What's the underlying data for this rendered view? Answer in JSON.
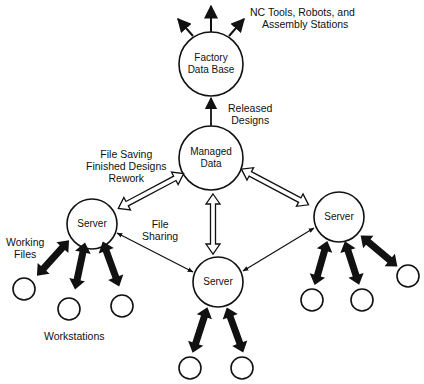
{
  "diagram": {
    "nodes": {
      "factory": {
        "line1": "Factory",
        "line2": "Data Base"
      },
      "managed": {
        "line1": "Managed",
        "line2": "Data"
      },
      "server_left": {
        "label": "Server"
      },
      "server_center": {
        "label": "Server"
      },
      "server_right": {
        "label": "Server"
      }
    },
    "labels": {
      "nc_tools_line1": "NC Tools, Robots, and",
      "nc_tools_line2": "Assembly Stations",
      "released_line1": "Released",
      "released_line2": "Designs",
      "file_saving_line1": "File Saving",
      "file_saving_line2": "Finished Designs",
      "file_saving_line3": "Rework",
      "file_sharing_line1": "File",
      "file_sharing_line2": "Sharing",
      "working_files_line1": "Working",
      "working_files_line2": "Files",
      "workstations": "Workstations"
    },
    "colors": {
      "stroke": "#111111",
      "background": "#ffffff"
    }
  }
}
